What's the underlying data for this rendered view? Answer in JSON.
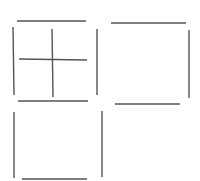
{
  "canvas": {
    "width": 200,
    "height": 181,
    "background": "#ffffff"
  },
  "style": {
    "stroke": "#555555",
    "stroke_width": 1.4
  },
  "figures": [
    {
      "name": "top-left-square-with-cross",
      "segments": [
        {
          "name": "top-edge",
          "x1": 17,
          "y1": 21,
          "x2": 86,
          "y2": 21
        },
        {
          "name": "left-edge",
          "x1": 13,
          "y1": 27,
          "x2": 14,
          "y2": 95
        },
        {
          "name": "right-edge",
          "x1": 97,
          "y1": 29,
          "x2": 97,
          "y2": 95
        },
        {
          "name": "cross-horizontal",
          "x1": 19,
          "y1": 59,
          "x2": 87,
          "y2": 60
        },
        {
          "name": "cross-vertical",
          "x1": 52,
          "y1": 29,
          "x2": 53,
          "y2": 97
        }
      ]
    },
    {
      "name": "top-right-square",
      "segments": [
        {
          "name": "top-edge",
          "x1": 111,
          "y1": 23,
          "x2": 186,
          "y2": 23
        },
        {
          "name": "right-edge",
          "x1": 189,
          "y1": 30,
          "x2": 189,
          "y2": 98
        }
      ]
    },
    {
      "name": "bottom-left-square",
      "segments": [
        {
          "name": "top-edge",
          "x1": 18,
          "y1": 101,
          "x2": 88,
          "y2": 101
        },
        {
          "name": "left-edge",
          "x1": 14,
          "y1": 112,
          "x2": 14,
          "y2": 178
        },
        {
          "name": "right-edge",
          "x1": 102,
          "y1": 111,
          "x2": 102,
          "y2": 177
        },
        {
          "name": "bottom-edge",
          "x1": 22,
          "y1": 179,
          "x2": 87,
          "y2": 179
        }
      ]
    },
    {
      "name": "bottom-right-square",
      "segments": [
        {
          "name": "top-edge",
          "x1": 115,
          "y1": 104,
          "x2": 180,
          "y2": 104
        }
      ]
    }
  ]
}
